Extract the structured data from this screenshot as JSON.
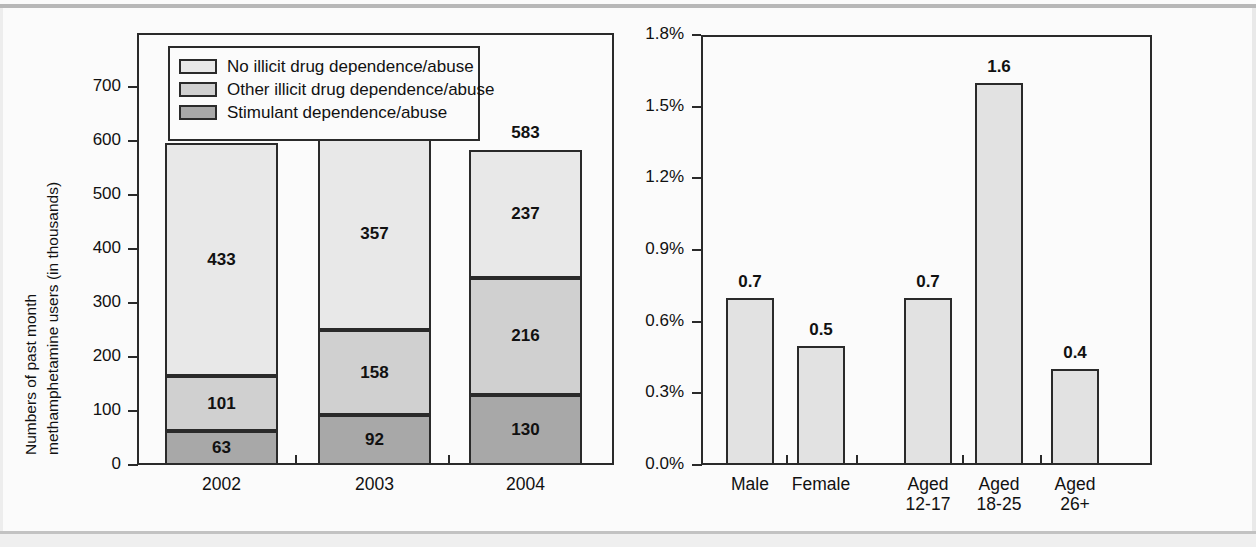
{
  "figure": {
    "background_color": "#fbfbfb",
    "line_color": "#2a2a2a"
  },
  "palette": {
    "no_illicit": "#e8e8e8",
    "other_illicit": "#d0d0d0",
    "stimulant": "#a8a8a8"
  },
  "legend": {
    "items": [
      {
        "label": "No illicit drug dependence/abuse",
        "color": "#e8e8e8",
        "key": "no_illicit"
      },
      {
        "label": "Other illicit drug dependence/abuse",
        "color": "#d0d0d0",
        "key": "other_illicit"
      },
      {
        "label": "Stimulant dependence/abuse",
        "color": "#a8a8a8",
        "key": "stimulant"
      }
    ]
  },
  "chart_data": [
    {
      "id": "left",
      "type": "bar",
      "stacked": true,
      "title": "",
      "xlabel": "",
      "ylabel": "Numbers of past month methamphetamine users (in thousands)",
      "ylabel_lines": [
        "Numbers of past month",
        "methamphetamine users (in thousands)"
      ],
      "categories": [
        "2002",
        "2003",
        "2004"
      ],
      "ylim": [
        0,
        800
      ],
      "yticks": [
        0,
        100,
        200,
        300,
        400,
        500,
        600,
        700
      ],
      "ytick_labels": [
        "0",
        "100",
        "200",
        "300",
        "400",
        "500",
        "600",
        "700"
      ],
      "grid": false,
      "legend_position": "top-inside",
      "series": [
        {
          "name": "Stimulant dependence/abuse",
          "key": "stimulant",
          "values": [
            63,
            92,
            130
          ]
        },
        {
          "name": "Other illicit drug dependence/abuse",
          "key": "other_illicit",
          "values": [
            101,
            158,
            216
          ]
        },
        {
          "name": "No illicit drug dependence/abuse",
          "key": "no_illicit",
          "values": [
            433,
            357,
            237
          ]
        }
      ],
      "totals": [
        597,
        607,
        583
      ],
      "total_labels": [
        "597",
        "607",
        "583"
      ],
      "segment_labels": [
        [
          "63",
          "101",
          "433"
        ],
        [
          "92",
          "158",
          "357"
        ],
        [
          "130",
          "216",
          "237"
        ]
      ]
    },
    {
      "id": "right",
      "type": "bar",
      "stacked": false,
      "title": "",
      "xlabel": "",
      "ylabel": "",
      "categories": [
        "Male",
        "Female",
        "Aged 12-17",
        "Aged 18-25",
        "Aged 26+"
      ],
      "category_lines": [
        [
          "Male"
        ],
        [
          "Female"
        ],
        [
          "Aged",
          "12-17"
        ],
        [
          "Aged",
          "18-25"
        ],
        [
          "Aged",
          "26+"
        ]
      ],
      "values": [
        0.7,
        0.5,
        0.7,
        1.6,
        0.4
      ],
      "value_labels": [
        "0.7",
        "0.5",
        "0.7",
        "1.6",
        "0.4"
      ],
      "ylim": [
        0.0,
        1.8
      ],
      "yticks": [
        0.0,
        0.3,
        0.6,
        0.9,
        1.2,
        1.5,
        1.8
      ],
      "ytick_labels": [
        "0.0%",
        "0.3%",
        "0.6%",
        "0.9%",
        "1.2%",
        "1.5%",
        "1.8%"
      ],
      "grid": false,
      "legend_position": "none",
      "bar_color": "#e2e2e2"
    }
  ]
}
